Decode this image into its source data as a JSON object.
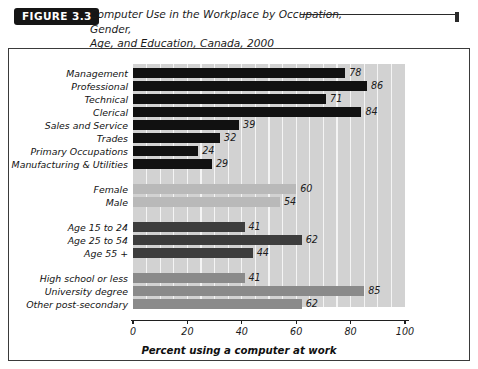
{
  "figure": {
    "badge": "FIGURE 3.3"
  },
  "chart_data": {
    "type": "bar",
    "orientation": "horizontal",
    "xlabel": "Percent using a computer at work",
    "ylabel": "",
    "xlim": [
      0,
      100
    ],
    "xticks": [
      0,
      20,
      40,
      60,
      80,
      100
    ],
    "xticklabels": [
      "0",
      "20",
      "40",
      "60",
      "80",
      "100"
    ],
    "grid": "vertical-minor-every-5",
    "legend": "none",
    "plot_background": "#d2d2d2",
    "groups": [
      {
        "name": "Occupation",
        "color": "#111111",
        "categories": [
          "Management",
          "Professional",
          "Technical",
          "Clerical",
          "Sales and Service",
          "Trades",
          "Primary Occupations",
          "Manufacturing & Utilities"
        ],
        "values": [
          78,
          86,
          71,
          84,
          39,
          32,
          24,
          29
        ]
      },
      {
        "name": "Gender",
        "color": "#b9b9b9",
        "categories": [
          "Female",
          "Male"
        ],
        "values": [
          60,
          54
        ]
      },
      {
        "name": "Age",
        "color": "#3d3d3d",
        "categories": [
          "Age 15 to 24",
          "Age 25 to 54",
          "Age 55 +"
        ],
        "values": [
          41,
          62,
          44
        ]
      },
      {
        "name": "Education",
        "color": "#8a8a8a",
        "categories": [
          "High school or less",
          "University degree",
          "Other post-secondary"
        ],
        "values": [
          41,
          85,
          62
        ]
      }
    ],
    "categories": [
      "Management",
      "Professional",
      "Technical",
      "Clerical",
      "Sales and Service",
      "Trades",
      "Primary Occupations",
      "Manufacturing & Utilities",
      "Female",
      "Male",
      "Age 15 to 24",
      "Age 25 to 54",
      "Age 55 +",
      "High school or less",
      "University degree",
      "Other post-secondary"
    ],
    "values": [
      78,
      86,
      71,
      84,
      39,
      32,
      24,
      29,
      60,
      54,
      41,
      62,
      44,
      41,
      85,
      62
    ]
  }
}
